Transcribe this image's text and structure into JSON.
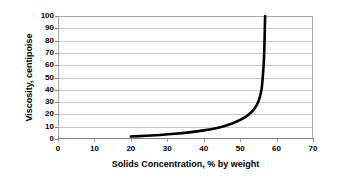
{
  "chart_data": {
    "type": "line",
    "title": "",
    "xlabel": "Solids Concentration, % by weight",
    "ylabel": "Viscosity, centipoise",
    "xlim": [
      0,
      70
    ],
    "ylim": [
      0,
      100
    ],
    "xticks": [
      0,
      10,
      20,
      30,
      40,
      50,
      60,
      70
    ],
    "yticks": [
      0,
      10,
      20,
      30,
      40,
      50,
      60,
      70,
      80,
      90,
      100
    ],
    "xtick_labels": [
      "0",
      "10",
      "20",
      "30",
      "40",
      "50",
      "60",
      "70"
    ],
    "ytick_labels": [
      "0",
      "10",
      "20",
      "30",
      "40",
      "50",
      "60",
      "70",
      "80",
      "90",
      "100"
    ],
    "grid": {
      "horizontal": true,
      "vertical": false,
      "color": "#c8c8c8"
    },
    "legend": {
      "visible": false,
      "position": "none"
    },
    "series": [
      {
        "name": "Viscosity vs Solids Concentration",
        "color": "#000000",
        "line_width": 2.6,
        "markers": false,
        "x": [
          20.0,
          24.0,
          28.0,
          32.0,
          36.0,
          40.0,
          43.0,
          46.0,
          48.0,
          50.0,
          51.5,
          53.0,
          54.0,
          54.8,
          55.4,
          55.9,
          56.2,
          56.5,
          56.7,
          56.85
        ],
        "y": [
          2.0,
          2.6,
          3.3,
          4.2,
          5.4,
          7.0,
          8.6,
          10.8,
          12.8,
          15.5,
          18.0,
          21.5,
          25.0,
          29.0,
          34.0,
          41.0,
          50.0,
          63.0,
          80.0,
          100.0
        ]
      }
    ],
    "annotations": []
  },
  "axes": {
    "y_title": "Viscosity, centipoise",
    "x_title": "Solids Concentration, % by weight"
  },
  "colors": {
    "series": "#000000",
    "gridline": "#c8c8c8",
    "border": "#a6a6a6",
    "axis": "#808080",
    "background": "#ffffff",
    "text": "#000000"
  }
}
